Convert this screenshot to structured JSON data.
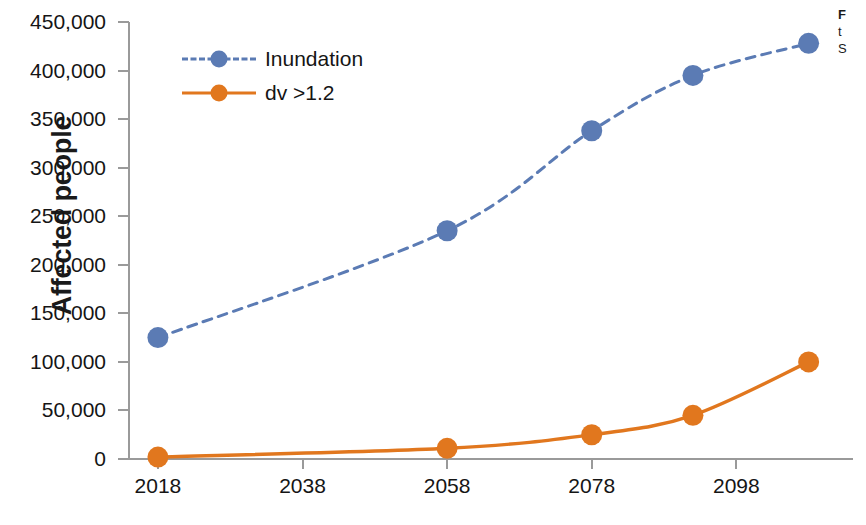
{
  "chart_data": {
    "type": "line",
    "title": "",
    "xlabel": "",
    "ylabel": "Affected people",
    "x": [
      2018,
      2058,
      2078,
      2092,
      2108
    ],
    "xtick_labels": [
      "2018",
      "2038",
      "2058",
      "2078",
      "2098"
    ],
    "xtick_values": [
      2018,
      2038,
      2058,
      2078,
      2098
    ],
    "xlim": [
      2014,
      2114
    ],
    "ytick_labels": [
      "0",
      "50,000",
      "100,000",
      "150,000",
      "200,000",
      "250,000",
      "300,000",
      "350,000",
      "400,000",
      "450,000"
    ],
    "ytick_values": [
      0,
      50000,
      100000,
      150000,
      200000,
      250000,
      300000,
      350000,
      400000,
      450000
    ],
    "ylim": [
      0,
      450000
    ],
    "grid": false,
    "legend_position": "inside upper-left",
    "series": [
      {
        "name": "Inundation",
        "color": "#5B7BB4",
        "style": "dashed",
        "marker": "circle",
        "values": [
          125000,
          235000,
          338000,
          395000,
          428000
        ]
      },
      {
        "name": "dv >1.2",
        "color": "#E1771E",
        "style": "solid",
        "marker": "circle",
        "values": [
          2000,
          11000,
          25000,
          45000,
          100000
        ]
      }
    ]
  },
  "legend": {
    "items": [
      {
        "label": "Inundation",
        "color": "#5B7BB4",
        "style": "dashed"
      },
      {
        "label": "dv >1.2",
        "color": "#E1771E",
        "style": "solid"
      }
    ]
  },
  "side_caption": {
    "line1": "F",
    "line2": "t",
    "line3": "S"
  },
  "colors": {
    "inundation": "#5B7BB4",
    "dv": "#E1771E",
    "axis": "#9a9a9a",
    "text": "#151515",
    "background": "#ffffff"
  }
}
